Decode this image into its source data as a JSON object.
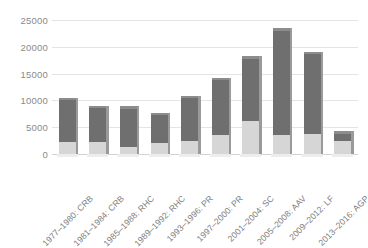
{
  "chart_data": {
    "type": "bar",
    "title": "",
    "subtitle": "",
    "xlabel": "",
    "ylabel": "",
    "ylim": [
      0,
      25000
    ],
    "yticks": [
      0,
      5000,
      10000,
      15000,
      20000,
      25000
    ],
    "ytick_labels": [
      "0",
      "5000",
      "10000",
      "15000",
      "20000",
      "25000"
    ],
    "grid": true,
    "legend": false,
    "legend_position": "none",
    "stacked": true,
    "orientation": "vertical",
    "categories": [
      "1977–1980: CRB",
      "1981–1984: CRB",
      "1985–1988: RHC",
      "1989–1992: RHC",
      "1993–1996: PR",
      "1997–2000: PR",
      "2001–2004: SC",
      "2005–2008: AAV",
      "2009–2012: LF",
      "2013–2016: AGP"
    ],
    "series": [
      {
        "name": "lower-segment",
        "color": "#d6d6d6",
        "values": [
          2200,
          2300,
          1400,
          2000,
          2400,
          3600,
          6200,
          3600,
          3700,
          2400
        ]
      },
      {
        "name": "upper-segment",
        "color": "#6f6f6f",
        "values": [
          7800,
          6200,
          7000,
          5200,
          8000,
          10200,
          11600,
          19400,
          14900,
          1400
        ]
      }
    ],
    "totals": [
      10000,
      8500,
      8400,
      7200,
      10400,
      13800,
      17800,
      23000,
      18600,
      3800
    ],
    "colors": {
      "upper": "#6f6f6f",
      "lower": "#d6d6d6",
      "gridline": "#e4e4e4",
      "axis_text": "#8a8a8a",
      "label_text": "#7d7d7d",
      "background": "#ffffff"
    }
  }
}
